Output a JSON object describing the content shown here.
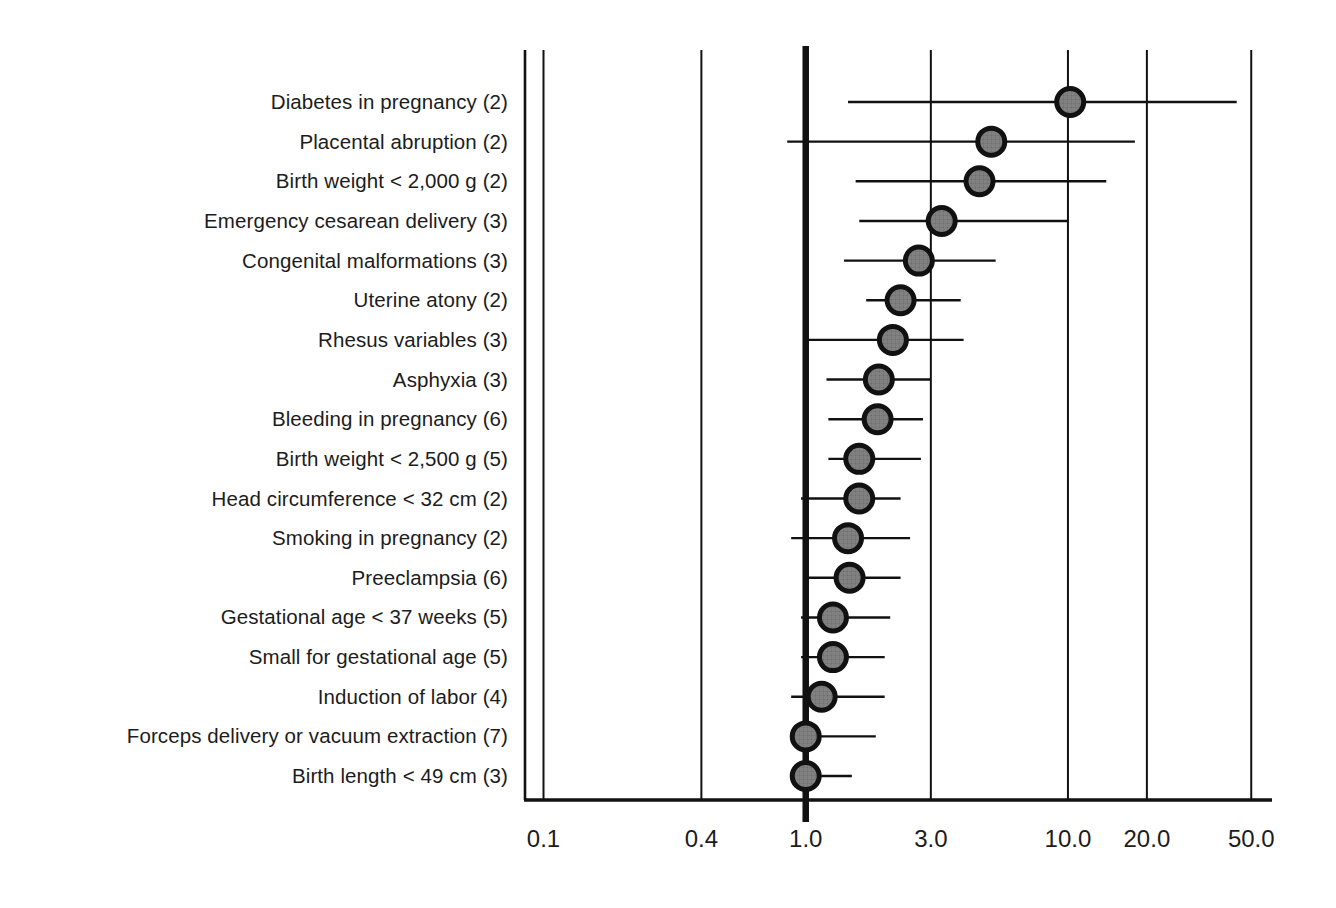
{
  "chart_data": {
    "type": "scatter",
    "subtype": "forest-plot",
    "title": "",
    "xlabel": "",
    "ylabel": "",
    "scale": "log",
    "xlim": [
      0.085,
      60.0
    ],
    "grid": true,
    "gridlines": [
      0.1,
      0.4,
      3.0,
      10.0,
      20.0,
      50.0
    ],
    "reference_line": 1.0,
    "tick_labels": [
      "0.1",
      "0.4",
      "1.0",
      "3.0",
      "10.0",
      "20.0",
      "50.0"
    ],
    "ticks": [
      0.1,
      0.4,
      1.0,
      3.0,
      10.0,
      20.0,
      50.0
    ],
    "marker_fill": "#6e6e6e",
    "marker_edge": "#111111",
    "line_color": "#111111",
    "axis_color": "#111111",
    "categories": [
      "Diabetes in pregnancy (2)",
      "Placental abruption (2)",
      "Birth weight < 2,000 g (2)",
      "Emergency cesarean delivery (3)",
      "Congenital malformations (3)",
      "Uterine atony (2)",
      "Rhesus variables (3)",
      "Asphyxia (3)",
      "Bleeding in pregnancy (6)",
      "Birth weight < 2,500 g (5)",
      "Head circumference < 32 cm (2)",
      "Smoking in pregnancy (2)",
      "Preeclampsia (6)",
      "Gestational age < 37 weeks (5)",
      "Small for gestational age (5)",
      "Induction of labor (4)",
      "Forceps delivery or vacuum extraction (7)",
      "Birth length < 49 cm (3)"
    ],
    "points": [
      {
        "label": "Diabetes in pregnancy (2)",
        "studies": 2,
        "estimate": 10.2,
        "ci_low": 1.45,
        "ci_high": 44.0
      },
      {
        "label": "Placental abruption (2)",
        "studies": 2,
        "estimate": 5.1,
        "ci_low": 0.85,
        "ci_high": 18.0
      },
      {
        "label": "Birth weight < 2,000 g (2)",
        "studies": 2,
        "estimate": 4.6,
        "ci_low": 1.55,
        "ci_high": 14.0
      },
      {
        "label": "Emergency cesarean delivery (3)",
        "studies": 3,
        "estimate": 3.3,
        "ci_low": 1.6,
        "ci_high": 10.0
      },
      {
        "label": "Congenital malformations (3)",
        "studies": 3,
        "estimate": 2.7,
        "ci_low": 1.4,
        "ci_high": 5.3
      },
      {
        "label": "Uterine atony (2)",
        "studies": 2,
        "estimate": 2.3,
        "ci_low": 1.7,
        "ci_high": 3.9
      },
      {
        "label": "Rhesus variables (3)",
        "studies": 3,
        "estimate": 2.15,
        "ci_low": 1.0,
        "ci_high": 4.0
      },
      {
        "label": "Asphyxia (3)",
        "studies": 3,
        "estimate": 1.9,
        "ci_low": 1.2,
        "ci_high": 3.0
      },
      {
        "label": "Bleeding in pregnancy (6)",
        "studies": 6,
        "estimate": 1.88,
        "ci_low": 1.22,
        "ci_high": 2.8
      },
      {
        "label": "Birth weight < 2,500 g (5)",
        "studies": 5,
        "estimate": 1.6,
        "ci_low": 1.22,
        "ci_high": 2.75
      },
      {
        "label": "Head circumference < 32 cm (2)",
        "studies": 2,
        "estimate": 1.6,
        "ci_low": 0.96,
        "ci_high": 2.3
      },
      {
        "label": "Smoking in pregnancy (2)",
        "studies": 2,
        "estimate": 1.45,
        "ci_low": 0.88,
        "ci_high": 2.5
      },
      {
        "label": "Preeclampsia (6)",
        "studies": 6,
        "estimate": 1.47,
        "ci_low": 1.02,
        "ci_high": 2.3
      },
      {
        "label": "Gestational age < 37 weeks (5)",
        "studies": 5,
        "estimate": 1.27,
        "ci_low": 0.96,
        "ci_high": 2.1
      },
      {
        "label": "Small for gestational age (5)",
        "studies": 5,
        "estimate": 1.27,
        "ci_low": 0.96,
        "ci_high": 2.0
      },
      {
        "label": "Induction of labor (4)",
        "studies": 4,
        "estimate": 1.15,
        "ci_low": 0.88,
        "ci_high": 2.0
      },
      {
        "label": "Forceps delivery or vacuum extraction (7)",
        "studies": 7,
        "estimate": 1.0,
        "ci_low": 0.89,
        "ci_high": 1.85
      },
      {
        "label": "Birth length < 49 cm (3)",
        "studies": 3,
        "estimate": 1.0,
        "ci_low": 0.9,
        "ci_high": 1.5
      }
    ]
  }
}
